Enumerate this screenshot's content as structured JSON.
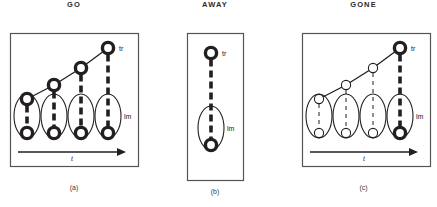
{
  "figure": {
    "background": "#ffffff",
    "ink": "#231f20",
    "frame_color": "#555555",
    "panels": [
      {
        "id": "a",
        "title": "GO",
        "caption": "(a)",
        "frame": {
          "x": 10,
          "y": 33,
          "w": 128,
          "h": 133
        },
        "axis": {
          "label": "t",
          "x1": 18,
          "x2": 126,
          "y": 152
        },
        "labels": {
          "top_right": "tr",
          "right_mid": "lm"
        },
        "style": "bold",
        "columns": [
          {
            "top_y": 99,
            "bottom_y": 133,
            "x": 27,
            "has_trace": true,
            "bold": true
          },
          {
            "top_y": 85,
            "bottom_y": 133,
            "x": 54,
            "has_trace": true,
            "bold": true
          },
          {
            "top_y": 68,
            "bottom_y": 133,
            "x": 81,
            "has_trace": true,
            "bold": true
          },
          {
            "top_y": 48,
            "bottom_y": 133,
            "x": 108,
            "has_trace": true,
            "bold": true
          }
        ],
        "ellipse": {
          "cy": 116,
          "rx": 13,
          "ry": 22
        },
        "trace_line": [
          [
            27,
            99
          ],
          [
            54,
            85
          ],
          [
            81,
            68
          ],
          [
            108,
            48
          ]
        ]
      },
      {
        "id": "b",
        "title": "AWAY",
        "caption": "(b)",
        "frame": {
          "x": 187,
          "y": 33,
          "w": 56,
          "h": 147
        },
        "axis": null,
        "labels": {
          "top_right": "tr",
          "right_mid": "lm"
        },
        "style": "bold",
        "columns": [
          {
            "top_y": 53,
            "bottom_y": 145,
            "x": 211,
            "has_trace": false,
            "bold": true
          }
        ],
        "ellipse": {
          "cy": 128,
          "rx": 13,
          "ry": 22
        },
        "trace_line": []
      },
      {
        "id": "c",
        "title": "GONE",
        "caption": "(c)",
        "frame": {
          "x": 302,
          "y": 33,
          "w": 128,
          "h": 133
        },
        "axis": {
          "label": "t",
          "x1": 310,
          "x2": 418,
          "y": 152
        },
        "labels": {
          "top_right": "tr",
          "right_mid": "lm"
        },
        "style": "mixed",
        "columns": [
          {
            "top_y": 99,
            "bottom_y": 133,
            "x": 319,
            "has_trace": true,
            "bold": false
          },
          {
            "top_y": 85,
            "bottom_y": 133,
            "x": 346,
            "has_trace": true,
            "bold": false
          },
          {
            "top_y": 68,
            "bottom_y": 133,
            "x": 373,
            "has_trace": true,
            "bold": false
          },
          {
            "top_y": 48,
            "bottom_y": 133,
            "x": 400,
            "has_trace": true,
            "bold": true
          }
        ],
        "ellipse": {
          "cy": 116,
          "rx": 13,
          "ry": 22
        },
        "trace_line": [
          [
            319,
            99
          ],
          [
            346,
            85
          ],
          [
            373,
            68
          ],
          [
            400,
            48
          ]
        ]
      }
    ]
  }
}
